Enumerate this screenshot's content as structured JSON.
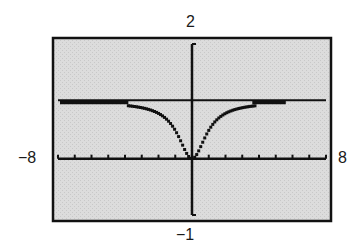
{
  "window": {
    "xmin_label": "−8",
    "xmax_label": "8",
    "ymin_label": "−1",
    "ymax_label": "2"
  },
  "colors": {
    "screen_bg": "#d9d9d9",
    "ink": "#111111",
    "frame": "#111111"
  },
  "chart_data": {
    "type": "line",
    "title": "",
    "xlabel": "",
    "ylabel": "",
    "xlim": [
      -8,
      8
    ],
    "ylim": [
      -1,
      2
    ],
    "x_ticks": [
      -8,
      -7,
      -6,
      -5,
      -4,
      -3,
      -2,
      -1,
      0,
      1,
      2,
      3,
      4,
      5,
      6,
      7,
      8
    ],
    "x_tick_labels_shown": [
      "-8",
      "8"
    ],
    "y_tick_labels_shown": [
      "-1",
      "2"
    ],
    "grid": false,
    "legend": null,
    "asymptote": {
      "type": "horizontal",
      "y": 1
    },
    "series": [
      {
        "name": "f(x)",
        "style": "dotted-pixel",
        "x": [
          -8,
          -7,
          -6,
          -5,
          -4,
          -3.5,
          -3,
          -2.5,
          -2,
          -1.5,
          -1,
          -0.5,
          0,
          0.5,
          1,
          1.5,
          2,
          2.5,
          3,
          3.5,
          4,
          5,
          6,
          7,
          8
        ],
        "values": [
          0.97,
          0.97,
          0.97,
          0.97,
          0.96,
          0.95,
          0.92,
          0.87,
          0.8,
          0.69,
          0.5,
          0.2,
          0,
          0.2,
          0.5,
          0.69,
          0.8,
          0.87,
          0.92,
          0.95,
          0.96,
          0.97,
          0.97,
          0.97,
          0.97
        ]
      }
    ]
  }
}
